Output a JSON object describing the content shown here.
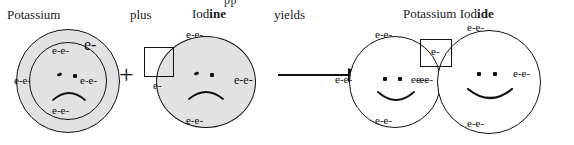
{
  "diagram": {
    "title_row": {
      "reactant1": "Potassium",
      "conjunction": "plus",
      "reactant2_plain": "Iod",
      "reactant2_bold": "ine",
      "yields": "yields",
      "product_plain": "Potassium Iod",
      "product_bold": "ide"
    },
    "clipped_top_text": "pp",
    "plus_symbol": "+",
    "arrow_name": "reaction-arrow",
    "colors": {
      "atom_fill_reactant": "#e2e2e2",
      "atom_fill_product": "#ffffff",
      "stroke": "#111111",
      "text": "#1a1a1a"
    },
    "potassium_atom": {
      "name": "potassium",
      "face": "frown",
      "shell_electrons": {
        "top": "e-e-",
        "left": "e-e-",
        "right": "e-e-",
        "bottom": "e-e-"
      },
      "valence_electron": "e-"
    },
    "iodine_atom": {
      "name": "iodine",
      "face": "frown",
      "shell_electrons": {
        "top": "e-e-",
        "bottom": "e-e-",
        "right": "e-e-",
        "left_in_box": "e-"
      },
      "empty_slot_box": ""
    },
    "product_potassium_ion": {
      "name": "potassium-ion",
      "face": "smile",
      "shell_electrons": {
        "top": "e-e-",
        "left": "e-e-",
        "right": "e-e-",
        "bottom": "e-e-"
      }
    },
    "product_iodide_ion": {
      "name": "iodide-ion",
      "face": "smile",
      "shell_electrons": {
        "top": "e-e-",
        "left": "e-",
        "right": "e-e-",
        "bottom": "e-e-"
      },
      "transferred_electron_in_box": "e-"
    }
  }
}
